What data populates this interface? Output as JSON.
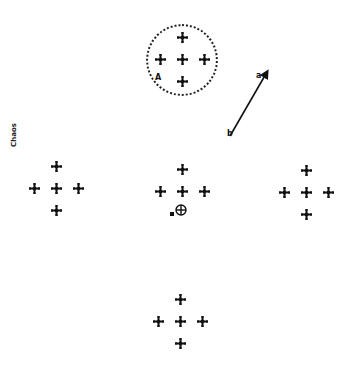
{
  "side_label": {
    "text": "Chaos"
  },
  "ring": {
    "cx": 182,
    "cy": 60,
    "r": 36,
    "marker_label": "A"
  },
  "arrow": {
    "x1": 230,
    "y1": 136,
    "x2": 267,
    "y2": 72,
    "start_label": "b",
    "end_label": "a"
  },
  "clusters": [
    {
      "name": "top",
      "cx": 182,
      "cy": 59
    },
    {
      "name": "left",
      "cx": 56,
      "cy": 188
    },
    {
      "name": "center",
      "cx": 182,
      "cy": 191
    },
    {
      "name": "right",
      "cx": 306,
      "cy": 192
    },
    {
      "name": "bottom",
      "cx": 180,
      "cy": 321
    }
  ],
  "cluster_offsets": [
    [
      0,
      -22
    ],
    [
      -22,
      0
    ],
    [
      0,
      0
    ],
    [
      22,
      0
    ],
    [
      0,
      22
    ]
  ],
  "center_marker": {
    "x": 181,
    "y": 210,
    "dot_x": 172,
    "dot_y": 214
  },
  "colors": {
    "ink": "#111111",
    "background": "#ffffff"
  }
}
